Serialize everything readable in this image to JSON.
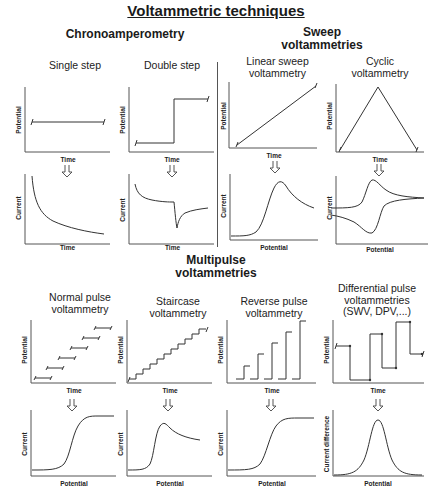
{
  "title": "Voltammetric techniques",
  "sections": {
    "chrono": "Chronoamperometry",
    "sweep": [
      "Sweep",
      "voltammetries"
    ],
    "multipulse": [
      "Multipulse",
      "voltammetries"
    ]
  },
  "techniques": {
    "single_step": [
      "Single step"
    ],
    "double_step": [
      "Double step"
    ],
    "linear_sweep": [
      "Linear sweep",
      "voltammetry"
    ],
    "cyclic": [
      "Cyclic",
      "voltammetry"
    ],
    "normal_pulse": [
      "Normal pulse",
      "voltammetry"
    ],
    "staircase": [
      "Staircase",
      "voltammetry"
    ],
    "reverse_pulse": [
      "Reverse pulse",
      "voltammetry"
    ],
    "differential_pulse": [
      "Differential pulse",
      "voltammetries",
      "(SWV, DPV,...)"
    ]
  },
  "axis_labels": {
    "potential": "Potential",
    "time": "Time",
    "current": "Current",
    "current_difference": "Current difference"
  },
  "colors": {
    "line": "#333333",
    "axis": "#555555"
  }
}
